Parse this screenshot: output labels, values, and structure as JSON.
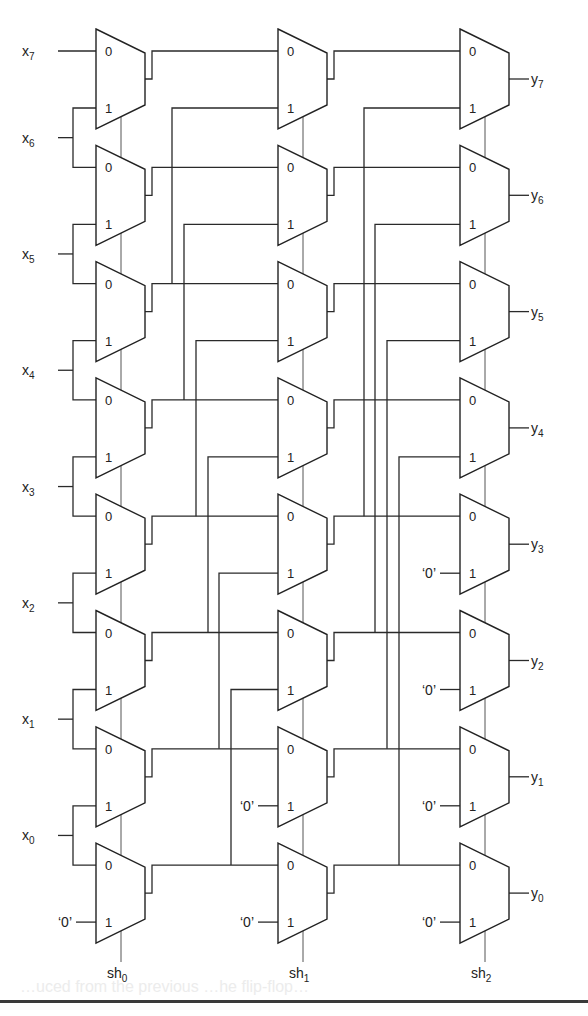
{
  "diagram": {
    "inputs": [
      "x7",
      "x6",
      "x5",
      "x4",
      "x3",
      "x2",
      "x1",
      "x0"
    ],
    "outputs": [
      "y7",
      "y6",
      "y5",
      "y4",
      "y3",
      "y2",
      "y1",
      "y0"
    ],
    "input_labels": [
      {
        "base": "x",
        "sub": "7"
      },
      {
        "base": "x",
        "sub": "6"
      },
      {
        "base": "x",
        "sub": "5"
      },
      {
        "base": "x",
        "sub": "4"
      },
      {
        "base": "x",
        "sub": "3"
      },
      {
        "base": "x",
        "sub": "2"
      },
      {
        "base": "x",
        "sub": "1"
      },
      {
        "base": "x",
        "sub": "0"
      }
    ],
    "output_labels": [
      {
        "base": "y",
        "sub": "7"
      },
      {
        "base": "y",
        "sub": "6"
      },
      {
        "base": "y",
        "sub": "5"
      },
      {
        "base": "y",
        "sub": "4"
      },
      {
        "base": "y",
        "sub": "3"
      },
      {
        "base": "y",
        "sub": "2"
      },
      {
        "base": "y",
        "sub": "1"
      },
      {
        "base": "y",
        "sub": "0"
      }
    ],
    "select_labels": [
      {
        "base": "sh",
        "sub": "0"
      },
      {
        "base": "sh",
        "sub": "1"
      },
      {
        "base": "sh",
        "sub": "2"
      }
    ],
    "mux_pin_labels": {
      "in0": "0",
      "in1": "1"
    },
    "constant_zero_label": "‘0’",
    "stages": [
      {
        "select": "sh0",
        "shift": 1,
        "zero_rows": [
          0
        ]
      },
      {
        "select": "sh1",
        "shift": 2,
        "zero_rows": [
          0,
          1
        ]
      },
      {
        "select": "sh2",
        "shift": 4,
        "zero_rows": [
          0,
          1,
          2,
          3
        ]
      }
    ],
    "colors": {
      "line": "#2a2a2a",
      "background": "#ffffff"
    }
  },
  "page_footer": {
    "bleed_text": "…uced from the previous …he flip-flop…"
  }
}
